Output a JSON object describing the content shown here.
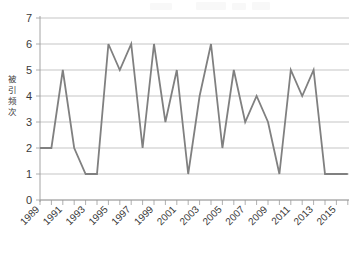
{
  "chart_data": {
    "type": "line",
    "title": "",
    "xlabel": "",
    "ylabel": "被引频次",
    "x": [
      1989,
      1990,
      1991,
      1992,
      1993,
      1994,
      1995,
      1996,
      1997,
      1998,
      1999,
      2000,
      2001,
      2002,
      2003,
      2004,
      2005,
      2006,
      2007,
      2008,
      2009,
      2010,
      2011,
      2012,
      2013,
      2014,
      2015,
      2016
    ],
    "values": [
      2,
      2,
      5,
      2,
      1,
      1,
      6,
      5,
      6,
      2,
      6,
      3,
      5,
      1,
      4,
      6,
      2,
      5,
      3,
      4,
      3,
      1,
      5,
      4,
      5,
      1,
      1,
      1
    ],
    "series": [
      {
        "name": "被引频次",
        "values": [
          2,
          2,
          5,
          2,
          1,
          1,
          6,
          5,
          6,
          2,
          6,
          3,
          5,
          1,
          4,
          6,
          2,
          5,
          3,
          4,
          3,
          1,
          5,
          4,
          5,
          1,
          1,
          1
        ],
        "color": "#808080"
      }
    ],
    "ylim": [
      0,
      7
    ],
    "yticks": [
      0,
      1,
      2,
      3,
      4,
      5,
      6,
      7
    ],
    "ytick_labels": [
      "0",
      "1",
      "2",
      "3",
      "4",
      "5",
      "6",
      "7"
    ],
    "xlim": [
      1989,
      2016
    ],
    "xticks": [
      1989,
      1991,
      1993,
      1995,
      1997,
      1999,
      2001,
      2003,
      2005,
      2007,
      2009,
      2011,
      2013,
      2015
    ],
    "xtick_labels": [
      "1989",
      "1991",
      "1993",
      "1995",
      "1997",
      "1999",
      "2001",
      "2003",
      "2005",
      "2007",
      "2009",
      "2011",
      "2013",
      "2015"
    ],
    "grid": "horizontal",
    "legend": "none",
    "markers": "none"
  },
  "colors": {
    "line": "#808080",
    "grid": "#aeaeae",
    "axis": "#9a9a9a",
    "text": "#3a3a3a",
    "background": "#ffffff"
  },
  "axis": {
    "y_label": "被引频次",
    "y_tick_labels": [
      "7",
      "6",
      "5",
      "4",
      "3",
      "2",
      "1",
      "0"
    ],
    "x_tick_labels": [
      "1989",
      "1991",
      "1993",
      "1995",
      "1997",
      "1999",
      "2001",
      "2003",
      "2005",
      "2007",
      "2009",
      "2011",
      "2013",
      "2015"
    ]
  }
}
